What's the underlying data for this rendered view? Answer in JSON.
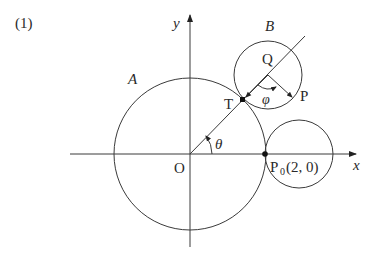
{
  "problem_number": "(1)",
  "labels": {
    "y_axis": "y",
    "x_axis": "x",
    "origin": "O",
    "circle_a": "A",
    "circle_b": "B",
    "center_q": "Q",
    "tangent_point": "T",
    "point_p": "P",
    "theta": "θ",
    "phi": "φ",
    "p0_name": "P",
    "p0_sub": "0",
    "p0_coords": "(2,  0)"
  },
  "colors": {
    "stroke": "#3a3a3a",
    "text": "#2a2a2a"
  }
}
